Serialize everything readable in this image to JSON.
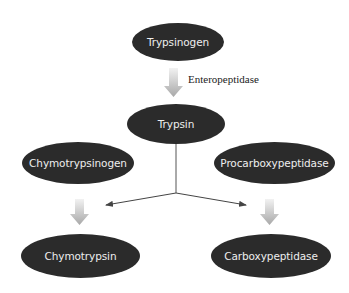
{
  "diagram": {
    "type": "flowchart",
    "nodes": {
      "trypsinogen": "Trypsinogen",
      "trypsin": "Trypsin",
      "chymotrypsinogen": "Chymotrypsinogen",
      "procarboxypeptidase": "Procarboxypeptidase",
      "chymotrypsin": "Chymotrypsin",
      "carboxypeptidase": "Carboxypeptidase"
    },
    "edge_labels": {
      "trypsinogen_to_trypsin": "Enteropeptidase"
    },
    "edges": [
      {
        "from": "Trypsinogen",
        "to": "Trypsin",
        "label": "Enteropeptidase",
        "style": "thick-gray-arrow"
      },
      {
        "from": "Trypsin",
        "to": "Chymotrypsinogen-conversion",
        "style": "thin-arrow"
      },
      {
        "from": "Trypsin",
        "to": "Procarboxypeptidase-conversion",
        "style": "thin-arrow"
      },
      {
        "from": "Chymotrypsinogen",
        "to": "Chymotrypsin",
        "style": "thick-gray-arrow"
      },
      {
        "from": "Procarboxypeptidase",
        "to": "Carboxypeptidase",
        "style": "thick-gray-arrow"
      }
    ],
    "colors": {
      "node_fill": "#2b2b2b",
      "node_text": "#eeeeee",
      "thick_arrow": "#b8b8b8",
      "thin_arrow": "#444444",
      "background": "#ffffff"
    }
  }
}
